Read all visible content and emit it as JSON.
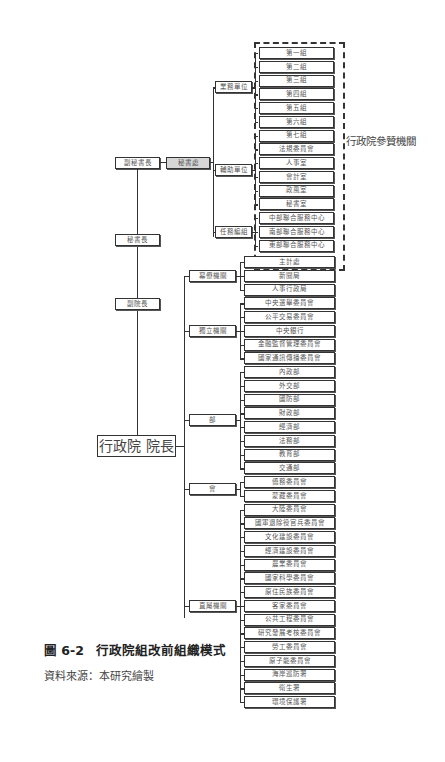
{
  "figure": {
    "caption_number": "圖 6-2",
    "caption_title": "行政院組改前組織模式",
    "source": "資料來源：本研究繪製"
  },
  "chain": {
    "premier": "行政院 院長",
    "vice_premier": "副院長",
    "secretary_general": "秘書長",
    "deputy_secretary_general": "副秘書長",
    "secretariat": "秘書處"
  },
  "staff_label": "行政院參贊機關",
  "secretariat_groups": [
    {
      "label": "業務單位",
      "items": [
        "第一組",
        "第二組",
        "第三組",
        "第四組",
        "第五組",
        "第六組"
      ]
    },
    {
      "label": "輔助單位",
      "items": [
        "第七組",
        "法規委員會",
        "人事室",
        "會計室",
        "政風室",
        "秘書室"
      ]
    },
    {
      "label": "任務編組",
      "items": [
        "中部聯合服務中心",
        "南部聯合服務中心",
        "東部聯合服務中心"
      ]
    }
  ],
  "agency_groups": [
    {
      "label": "幕僚機關",
      "items": [
        "主計處",
        "新聞局",
        "人事行政局"
      ]
    },
    {
      "label": "獨立機關",
      "items": [
        "中央選舉委員會",
        "公平交易委員會",
        "中央銀行",
        "金融監督管理委員會",
        "國家通訊傳播委員會"
      ]
    },
    {
      "label": "部",
      "items": [
        "內政部",
        "外交部",
        "國防部",
        "財政部",
        "經濟部",
        "法務部",
        "教育部",
        "交通部"
      ]
    },
    {
      "label": "會",
      "items": [
        "僑務委員會",
        "蒙藏委員會"
      ]
    },
    {
      "label": "直屬機關",
      "items": [
        "大陸委員會",
        "國軍退除役官兵委員會",
        "文化建設委員會",
        "經濟建設委員會",
        "農業委員會",
        "國家科學委員會",
        "原住民族委員會",
        "客家委員會",
        "公共工程委員會",
        "研究發展考核委員會",
        "勞工委員會",
        "原子能委員會",
        "海岸巡防署",
        "衛生署",
        "環境保護署"
      ]
    }
  ]
}
